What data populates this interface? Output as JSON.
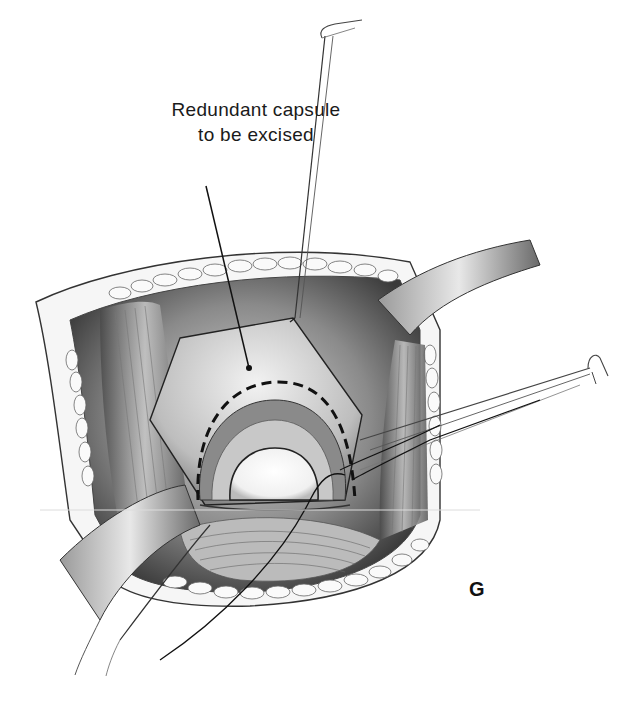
{
  "figure": {
    "panel_letter": "G",
    "callout": {
      "line1": "Redundant capsule",
      "line2": "to be excised"
    },
    "style": "grayscale pencil surgical illustration",
    "elements": [
      "retracted incision with subcutaneous fat lobules",
      "upper retractor with hooked tip",
      "right-side retractor hook",
      "pentagonal capsular flap",
      "dashed excision line",
      "femoral head within joint",
      "sutures",
      "lower curved retractor blades",
      "underlying muscle fibers"
    ],
    "colors": {
      "ink": "#1a1a1a",
      "shadow": "#555555",
      "mid": "#9a9a9a",
      "light": "#e6e6e6",
      "paper": "#ffffff"
    }
  }
}
